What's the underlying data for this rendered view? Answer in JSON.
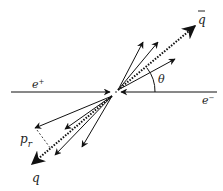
{
  "diagram": {
    "labels": {
      "positron": "e",
      "positron_sup": "+",
      "electron": "e",
      "electron_sup": "−",
      "antiquark": "q",
      "quark": "q",
      "angle": "θ",
      "transverse_momentum": "p",
      "transverse_momentum_sub": "r"
    },
    "colors": {
      "stroke": "#111111",
      "background": "#ffffff"
    },
    "vertex": {
      "x": 116,
      "y": 92
    },
    "beams": [
      {
        "name": "positron-beam",
        "from": [
          11,
          92
        ],
        "to": [
          110,
          92
        ]
      },
      {
        "name": "electron-beam",
        "from": [
          217,
          92
        ],
        "to": [
          121,
          92
        ]
      }
    ],
    "jet_upper": {
      "axis_tip": [
        195,
        26
      ],
      "tracks": [
        [
          143,
          42
        ],
        [
          158,
          42
        ],
        [
          175,
          59
        ]
      ]
    },
    "jet_lower": {
      "axis_tip": [
        32,
        164
      ],
      "tracks": [
        [
          35,
          128
        ],
        [
          65,
          129
        ],
        [
          82,
          147
        ],
        [
          55,
          155
        ]
      ]
    }
  }
}
